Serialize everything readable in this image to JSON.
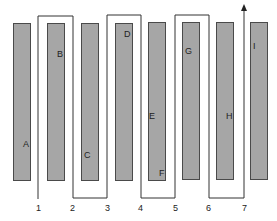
{
  "diagram": {
    "type": "serpentine pick path through aisles",
    "bar_color": "#a6a6a6",
    "bar_border": "#4a4a4a",
    "path_color": "#333333",
    "bars": [
      {
        "x": 13,
        "y": 23,
        "w": 18,
        "h": 158
      },
      {
        "x": 47,
        "y": 23,
        "w": 18,
        "h": 158
      },
      {
        "x": 81,
        "y": 23,
        "w": 18,
        "h": 158
      },
      {
        "x": 115,
        "y": 23,
        "w": 18,
        "h": 158
      },
      {
        "x": 148,
        "y": 22,
        "w": 18,
        "h": 159
      },
      {
        "x": 182,
        "y": 22,
        "w": 18,
        "h": 158
      },
      {
        "x": 216,
        "y": 22,
        "w": 18,
        "h": 158
      },
      {
        "x": 250,
        "y": 22,
        "w": 18,
        "h": 158
      }
    ],
    "letters": [
      {
        "label": "A",
        "x": 23,
        "y": 140
      },
      {
        "label": "B",
        "x": 57,
        "y": 50
      },
      {
        "label": "C",
        "x": 84,
        "y": 151
      },
      {
        "label": "D",
        "x": 124,
        "y": 30
      },
      {
        "label": "E",
        "x": 149,
        "y": 112
      },
      {
        "label": "F",
        "x": 159,
        "y": 169
      },
      {
        "label": "G",
        "x": 185,
        "y": 47
      },
      {
        "label": "H",
        "x": 226,
        "y": 112
      },
      {
        "label": "I",
        "x": 253,
        "y": 42
      }
    ],
    "numbers": [
      {
        "label": "1",
        "x": 36,
        "y": 204
      },
      {
        "label": "2",
        "x": 70,
        "y": 204
      },
      {
        "label": "3",
        "x": 105,
        "y": 204
      },
      {
        "label": "4",
        "x": 138,
        "y": 204
      },
      {
        "label": "5",
        "x": 173,
        "y": 204
      },
      {
        "label": "6",
        "x": 206,
        "y": 204
      },
      {
        "label": "7",
        "x": 242,
        "y": 204
      }
    ],
    "path_points": "38,199 38,16 73,16 73,198 107,198 107,15 141,15 141,198 175,198 175,15 209,15 209,198 244,198 244,9"
  }
}
